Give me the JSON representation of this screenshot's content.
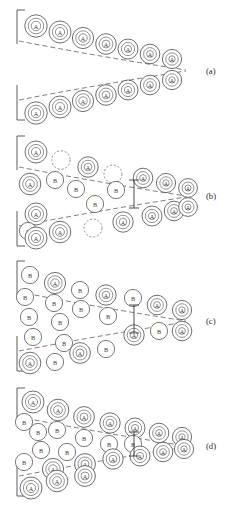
{
  "figure": {
    "background_color": "#ffffff",
    "width": 236,
    "height": 513,
    "legend": {
      "matrix_atom_symbol": "A",
      "solute_atom_symbol": "B",
      "vacancy_style": "dashed circle"
    }
  },
  "panels": [
    {
      "id": "a",
      "label": "(a)",
      "label_x": 206,
      "label_y": 71,
      "origin_y": 0,
      "description": "Clean crack with A matrix atoms on both crack surfaces",
      "tip": {
        "x": 186,
        "y": 70
      },
      "edge_lines": [
        {
          "x1": 17,
          "y1": 10,
          "x2": 17,
          "y2": 44
        },
        {
          "x1": 17,
          "y1": 10,
          "x2": 25,
          "y2": 10
        },
        {
          "x1": 17,
          "y1": 85,
          "x2": 17,
          "y2": 120
        },
        {
          "x1": 17,
          "y1": 120,
          "x2": 25,
          "y2": 120
        }
      ],
      "surfaces": [
        {
          "name": "upper-surface",
          "path": "M 19 41 Q 96 56 186 70"
        },
        {
          "name": "lower-surface",
          "path": "M 19 100 Q 96 85 186 71"
        }
      ],
      "dimension_marker": null,
      "atoms": [
        {
          "type": "A",
          "cx": 36,
          "cy": 26,
          "r": 11.2
        },
        {
          "type": "A",
          "cx": 60,
          "cy": 32,
          "r": 11.0
        },
        {
          "type": "A",
          "cx": 83,
          "cy": 38,
          "r": 10.6
        },
        {
          "type": "A",
          "cx": 106,
          "cy": 44,
          "r": 10.3
        },
        {
          "type": "A",
          "cx": 128,
          "cy": 49,
          "r": 10.0
        },
        {
          "type": "A",
          "cx": 150,
          "cy": 54,
          "r": 9.8
        },
        {
          "type": "A",
          "cx": 172,
          "cy": 59,
          "r": 9.6
        },
        {
          "type": "A",
          "cx": 36,
          "cy": 113,
          "r": 11.2
        },
        {
          "type": "A",
          "cx": 60,
          "cy": 107,
          "r": 11.0
        },
        {
          "type": "A",
          "cx": 83,
          "cy": 101,
          "r": 10.6
        },
        {
          "type": "A",
          "cx": 106,
          "cy": 95,
          "r": 10.3
        },
        {
          "type": "A",
          "cx": 128,
          "cy": 90,
          "r": 10.0
        },
        {
          "type": "A",
          "cx": 150,
          "cy": 85,
          "r": 9.8
        },
        {
          "type": "A",
          "cx": 172,
          "cy": 80,
          "r": 9.6
        }
      ]
    },
    {
      "id": "b",
      "label": "(b)",
      "label_x": 206,
      "label_y": 196,
      "origin_y": 125,
      "description": "Early solute B segregation with vacancies near crack surfaces",
      "tip": {
        "x": 186,
        "y": 196
      },
      "edge_lines": [
        {
          "x1": 17,
          "y1": 136,
          "x2": 17,
          "y2": 170
        },
        {
          "x1": 17,
          "y1": 136,
          "x2": 25,
          "y2": 136
        },
        {
          "x1": 17,
          "y1": 211,
          "x2": 17,
          "y2": 246
        },
        {
          "x1": 17,
          "y1": 246,
          "x2": 25,
          "y2": 246
        }
      ],
      "surfaces": [
        {
          "name": "upper-surface",
          "path": "M 19 167 Q 96 182 186 196"
        },
        {
          "name": "lower-surface",
          "path": "M 19 226 Q 96 211 186 197"
        }
      ],
      "dimension_marker": {
        "x": 134,
        "y_top": 180,
        "y_bottom": 208,
        "cap": 5
      },
      "atoms": [
        {
          "type": "A",
          "cx": 36,
          "cy": 152,
          "r": 11.0
        },
        {
          "type": "V",
          "cx": 61,
          "cy": 160,
          "r": 9.2
        },
        {
          "type": "A",
          "cx": 88,
          "cy": 167,
          "r": 10.2
        },
        {
          "type": "V",
          "cx": 113,
          "cy": 174,
          "r": 9.0
        },
        {
          "type": "A",
          "cx": 143,
          "cy": 178,
          "r": 9.8
        },
        {
          "type": "A",
          "cx": 166,
          "cy": 183,
          "r": 9.6
        },
        {
          "type": "A",
          "cx": 188,
          "cy": 188,
          "r": 9.4
        },
        {
          "type": "A",
          "cx": 30,
          "cy": 184,
          "r": 10.8
        },
        {
          "type": "B",
          "cx": 55,
          "cy": 180,
          "r": 8.6
        },
        {
          "type": "B",
          "cx": 76,
          "cy": 189,
          "r": 8.6
        },
        {
          "type": "B",
          "cx": 116,
          "cy": 190,
          "r": 8.6
        },
        {
          "type": "B",
          "cx": 95,
          "cy": 204,
          "r": 8.6
        },
        {
          "type": "A",
          "cx": 36,
          "cy": 214,
          "r": 11.0
        },
        {
          "type": "B",
          "cx": 28,
          "cy": 231,
          "r": 8.6
        },
        {
          "type": "V",
          "cx": 93,
          "cy": 228,
          "r": 9.0
        },
        {
          "type": "A",
          "cx": 123,
          "cy": 222,
          "r": 10.2
        },
        {
          "type": "A",
          "cx": 36,
          "cy": 238,
          "r": 11.0
        },
        {
          "type": "A",
          "cx": 60,
          "cy": 232,
          "r": 10.8
        },
        {
          "type": "A",
          "cx": 152,
          "cy": 216,
          "r": 10.0
        },
        {
          "type": "A",
          "cx": 174,
          "cy": 211,
          "r": 9.8
        },
        {
          "type": "A",
          "cx": 188,
          "cy": 207,
          "r": 9.4
        }
      ]
    },
    {
      "id": "c",
      "label": "(c)",
      "label_x": 206,
      "label_y": 321,
      "origin_y": 250,
      "description": "Heavy solute B enrichment filling the crack interior",
      "tip": {
        "x": 186,
        "y": 321
      },
      "edge_lines": [
        {
          "x1": 17,
          "y1": 261,
          "x2": 17,
          "y2": 295
        },
        {
          "x1": 17,
          "y1": 261,
          "x2": 25,
          "y2": 261
        },
        {
          "x1": 17,
          "y1": 336,
          "x2": 17,
          "y2": 371
        },
        {
          "x1": 17,
          "y1": 371,
          "x2": 25,
          "y2": 371
        }
      ],
      "surfaces": [
        {
          "name": "upper-surface",
          "path": "M 19 292 Q 96 307 186 321"
        },
        {
          "name": "lower-surface",
          "path": "M 19 351 Q 96 336 186 322"
        }
      ],
      "dimension_marker": {
        "x": 134,
        "y_top": 305,
        "y_bottom": 333,
        "cap": 5
      },
      "atoms": [
        {
          "type": "B",
          "cx": 30,
          "cy": 275,
          "r": 8.6
        },
        {
          "type": "A",
          "cx": 55,
          "cy": 283,
          "r": 10.6
        },
        {
          "type": "B",
          "cx": 80,
          "cy": 290,
          "r": 8.6
        },
        {
          "type": "A",
          "cx": 106,
          "cy": 295,
          "r": 10.2
        },
        {
          "type": "B",
          "cx": 133,
          "cy": 298,
          "r": 8.6
        },
        {
          "type": "A",
          "cx": 157,
          "cy": 305,
          "r": 9.8
        },
        {
          "type": "A",
          "cx": 182,
          "cy": 310,
          "r": 9.6
        },
        {
          "type": "B",
          "cx": 25,
          "cy": 297,
          "r": 8.6
        },
        {
          "type": "B",
          "cx": 54,
          "cy": 303,
          "r": 8.6
        },
        {
          "type": "B",
          "cx": 81,
          "cy": 309,
          "r": 8.6
        },
        {
          "type": "B",
          "cx": 29,
          "cy": 317,
          "r": 8.6
        },
        {
          "type": "B",
          "cx": 60,
          "cy": 322,
          "r": 8.6
        },
        {
          "type": "B",
          "cx": 108,
          "cy": 316,
          "r": 8.6
        },
        {
          "type": "B",
          "cx": 33,
          "cy": 337,
          "r": 8.6
        },
        {
          "type": "B",
          "cx": 64,
          "cy": 343,
          "r": 8.6
        },
        {
          "type": "A",
          "cx": 134,
          "cy": 335,
          "r": 10.2
        },
        {
          "type": "B",
          "cx": 159,
          "cy": 331,
          "r": 8.6
        },
        {
          "type": "A",
          "cx": 182,
          "cy": 331,
          "r": 9.8
        },
        {
          "type": "B",
          "cx": 106,
          "cy": 349,
          "r": 8.6
        },
        {
          "type": "A",
          "cx": 80,
          "cy": 353,
          "r": 10.4
        },
        {
          "type": "B",
          "cx": 55,
          "cy": 362,
          "r": 8.6
        },
        {
          "type": "A",
          "cx": 30,
          "cy": 363,
          "r": 10.8
        }
      ]
    },
    {
      "id": "d",
      "label": "(d)",
      "label_x": 206,
      "label_y": 446,
      "origin_y": 378,
      "description": "Solute B pushed back to crack mouth, A atoms re-line the surfaces",
      "tip": {
        "x": 186,
        "y": 446
      },
      "edge_lines": [
        {
          "x1": 17,
          "y1": 388,
          "x2": 17,
          "y2": 422
        },
        {
          "x1": 17,
          "y1": 388,
          "x2": 25,
          "y2": 388
        },
        {
          "x1": 17,
          "y1": 461,
          "x2": 17,
          "y2": 496
        },
        {
          "x1": 17,
          "y1": 496,
          "x2": 25,
          "y2": 496
        }
      ],
      "surfaces": [
        {
          "name": "upper-surface",
          "path": "M 19 417 Q 96 432 186 446"
        },
        {
          "name": "lower-surface",
          "path": "M 19 476 Q 96 461 186 447"
        }
      ],
      "dimension_marker": {
        "x": 134,
        "y_top": 432,
        "y_bottom": 456,
        "cap": 5
      },
      "atoms": [
        {
          "type": "A",
          "cx": 33,
          "cy": 402,
          "r": 11.0
        },
        {
          "type": "A",
          "cx": 58,
          "cy": 410,
          "r": 10.8
        },
        {
          "type": "A",
          "cx": 84,
          "cy": 417,
          "r": 10.4
        },
        {
          "type": "A",
          "cx": 110,
          "cy": 423,
          "r": 10.2
        },
        {
          "type": "A",
          "cx": 135,
          "cy": 428,
          "r": 10.0
        },
        {
          "type": "A",
          "cx": 159,
          "cy": 433,
          "r": 9.8
        },
        {
          "type": "A",
          "cx": 182,
          "cy": 437,
          "r": 9.6
        },
        {
          "type": "B",
          "cx": 24,
          "cy": 422,
          "r": 8.6
        },
        {
          "type": "B",
          "cx": 38,
          "cy": 432,
          "r": 8.6
        },
        {
          "type": "B",
          "cx": 57,
          "cy": 430,
          "r": 8.6
        },
        {
          "type": "B",
          "cx": 84,
          "cy": 438,
          "r": 8.6
        },
        {
          "type": "B",
          "cx": 109,
          "cy": 444,
          "r": 8.6
        },
        {
          "type": "B",
          "cx": 133,
          "cy": 444,
          "r": 8.6
        },
        {
          "type": "B",
          "cx": 41,
          "cy": 450,
          "r": 8.6
        },
        {
          "type": "B",
          "cx": 67,
          "cy": 452,
          "r": 8.6
        },
        {
          "type": "B",
          "cx": 24,
          "cy": 462,
          "r": 8.6
        },
        {
          "type": "A",
          "cx": 53,
          "cy": 469,
          "r": 10.6
        },
        {
          "type": "A",
          "cx": 85,
          "cy": 464,
          "r": 10.4
        },
        {
          "type": "A",
          "cx": 113,
          "cy": 459,
          "r": 10.2
        },
        {
          "type": "A",
          "cx": 140,
          "cy": 456,
          "r": 10.0
        },
        {
          "type": "A",
          "cx": 163,
          "cy": 452,
          "r": 9.8
        },
        {
          "type": "A",
          "cx": 184,
          "cy": 449,
          "r": 9.6
        },
        {
          "type": "A",
          "cx": 31,
          "cy": 488,
          "r": 11.0
        },
        {
          "type": "A",
          "cx": 57,
          "cy": 481,
          "r": 10.8
        },
        {
          "type": "A",
          "cx": 85,
          "cy": 476,
          "r": 10.4
        }
      ]
    }
  ]
}
